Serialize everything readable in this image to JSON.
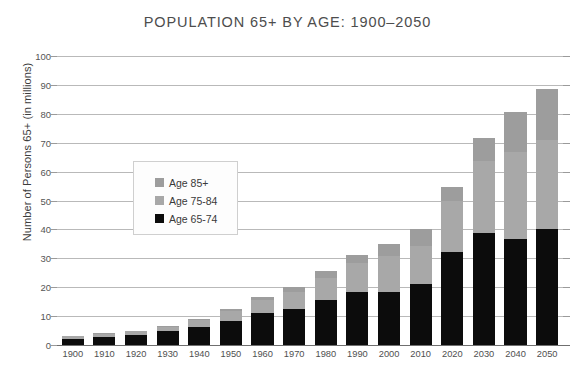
{
  "chart_data": {
    "type": "bar",
    "title": "POPULATION 65+ BY AGE: 1900–2050",
    "xlabel": "",
    "ylabel": "Number of Persons 65+ (in millions)",
    "ylim": [
      0,
      100
    ],
    "ytick_step": 10,
    "yticks": [
      "100",
      "90",
      "80",
      "70",
      "60",
      "50",
      "40",
      "30",
      "20",
      "10",
      "0"
    ],
    "grid": true,
    "stacked": true,
    "legend_position": "inside-left",
    "categories": [
      "1900",
      "1910",
      "1920",
      "1930",
      "1940",
      "1950",
      "1960",
      "1970",
      "1980",
      "1990",
      "2000",
      "2010",
      "2020",
      "2030",
      "2040",
      "2050"
    ],
    "series": [
      {
        "name": "Age 65-74",
        "color": "#0c0c0c",
        "values": [
          2.2,
          2.8,
          3.5,
          4.7,
          6.4,
          8.4,
          11.0,
          12.4,
          15.6,
          18.4,
          18.4,
          21.1,
          32.3,
          38.6,
          36.8,
          40.0
        ]
      },
      {
        "name": "Age 75-84",
        "color": "#a8a8a8",
        "values": [
          0.8,
          1.0,
          1.2,
          1.6,
          2.3,
          3.3,
          4.6,
          6.1,
          7.7,
          10.1,
          12.4,
          13.1,
          17.4,
          25.2,
          30.1,
          30.9
        ]
      },
      {
        "name": "Age 85+",
        "color": "#9d9d9d",
        "values": [
          0.1,
          0.2,
          0.2,
          0.3,
          0.3,
          0.7,
          1.1,
          1.6,
          2.4,
          2.7,
          4.2,
          6.0,
          4.9,
          7.7,
          13.8,
          17.6
        ]
      }
    ],
    "totals": [
      3.1,
      4.0,
      4.9,
      6.6,
      9.0,
      12.4,
      16.7,
      20.1,
      25.7,
      31.2,
      35.0,
      40.2,
      54.6,
      71.5,
      80.7,
      88.5
    ]
  },
  "legend": {
    "items": [
      {
        "label": "Age 85+",
        "swatch": "legend-swatch-age-85-plus"
      },
      {
        "label": "Age 75-84",
        "swatch": "legend-swatch-age-75-84"
      },
      {
        "label": "Age 65-74",
        "swatch": "legend-swatch-age-65-74"
      }
    ]
  }
}
